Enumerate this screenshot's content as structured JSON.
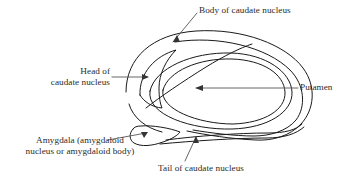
{
  "figure": {
    "type": "anatomical-line-diagram",
    "background_color": "#ffffff",
    "line_color": "#1a1a1a",
    "leader_color": "#555555",
    "text_color": "#2b2b2b"
  },
  "labels": {
    "body_caudate": {
      "text": "Body of caudate nucleus",
      "lines": [
        "Body of caudate nucleus"
      ]
    },
    "head_caudate": {
      "text": "Head of caudate nucleus",
      "lines": [
        "Head of",
        "caudate nucleus"
      ]
    },
    "putamen": {
      "text": "Putamen",
      "lines": [
        "Putamen"
      ]
    },
    "amygdala": {
      "text": "Amygdala (amygdaloid nucleus or amygdaloid body)",
      "lines": [
        "Amygdala (amygdaloid",
        "nucleus or amygdaloid body)"
      ]
    },
    "tail_caudate": {
      "text": "Tail of caudate nucleus",
      "lines": [
        "Tail of caudate nucleus"
      ]
    }
  }
}
